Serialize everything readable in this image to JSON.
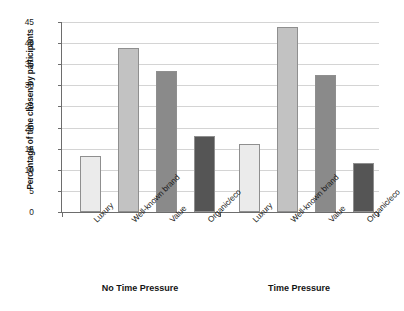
{
  "chart_data": {
    "type": "bar",
    "title": "",
    "subtitle": "",
    "xlabel": "",
    "ylabel": "Percentage of time chosen by participants",
    "ylim": [
      0,
      45
    ],
    "yticks": [
      0,
      5,
      10,
      15,
      20,
      25,
      30,
      35,
      40,
      45
    ],
    "ytick_labels": [
      "0",
      "5",
      "10",
      "15",
      "20",
      "25",
      "30",
      "35",
      "40",
      "45"
    ],
    "grid": true,
    "legend": false,
    "legend_position": "none",
    "categories": [
      "Luxury",
      "Well-known brand",
      "Value",
      "Organic/eco"
    ],
    "groups": [
      "No Time Pressure",
      "Time Pressure"
    ],
    "series": [
      {
        "name": "No Time Pressure",
        "values": [
          13.3,
          38.9,
          33.3,
          17.9
        ]
      },
      {
        "name": "Time Pressure",
        "values": [
          16.2,
          43.8,
          32.4,
          11.5
        ]
      }
    ],
    "bars": [
      {
        "group": "No Time Pressure",
        "category": "Luxury",
        "value": 13.3,
        "color": "#ebebeb"
      },
      {
        "group": "No Time Pressure",
        "category": "Well-known brand",
        "value": 38.9,
        "color": "#c2c2c2"
      },
      {
        "group": "No Time Pressure",
        "category": "Value",
        "value": 33.3,
        "color": "#8a8a8a"
      },
      {
        "group": "No Time Pressure",
        "category": "Organic/eco",
        "value": 17.9,
        "color": "#555555"
      },
      {
        "group": "Time Pressure",
        "category": "Luxury",
        "value": 16.2,
        "color": "#ebebeb"
      },
      {
        "group": "Time Pressure",
        "category": "Well-known brand",
        "value": 43.8,
        "color": "#c2c2c2"
      },
      {
        "group": "Time Pressure",
        "category": "Value",
        "value": 32.4,
        "color": "#8a8a8a"
      },
      {
        "group": "Time Pressure",
        "category": "Organic/eco",
        "value": 11.5,
        "color": "#555555"
      }
    ],
    "colors": {
      "luxury": "#ebebeb",
      "well_known_brand": "#c2c2c2",
      "value": "#8a8a8a",
      "organic_eco": "#555555",
      "axis": "#6d6d6d",
      "grid": "#d4d4d4",
      "background": "#ffffff",
      "text": "#1a1a1a"
    }
  }
}
